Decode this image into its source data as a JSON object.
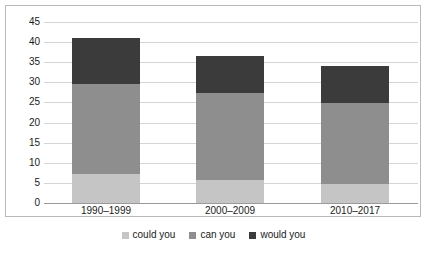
{
  "chart_data": {
    "type": "bar",
    "subtype": "stacked-column",
    "title": "",
    "xlabel": "",
    "ylabel": "",
    "categories": [
      "1990–1999",
      "2000–2009",
      "2010–2017"
    ],
    "series": [
      {
        "name": "could you",
        "color": "#c5c5c5",
        "values": [
          7.2,
          5.7,
          4.7
        ]
      },
      {
        "name": "can you",
        "color": "#8e8e8e",
        "values": [
          22.5,
          21.7,
          20.2
        ]
      },
      {
        "name": "would you",
        "color": "#3b3b3b",
        "values": [
          11.3,
          9.1,
          9.1
        ]
      }
    ],
    "totals": [
      41.0,
      36.5,
      34.0
    ],
    "ylim": [
      0,
      45
    ],
    "yticks": [
      0,
      5,
      10,
      15,
      20,
      25,
      30,
      35,
      40,
      45
    ],
    "ytick_labels": [
      "0",
      "5",
      "10",
      "15",
      "20",
      "25",
      "30",
      "35",
      "40",
      "45"
    ],
    "grid": "horizontal",
    "legend_position": "bottom"
  },
  "axis": {
    "y_labels": [
      "45",
      "40",
      "35",
      "30",
      "25",
      "20",
      "15",
      "10",
      "5",
      "0"
    ],
    "x_labels": [
      "1990–1999",
      "2000–2009",
      "2010–2017"
    ]
  },
  "legend": {
    "items": [
      {
        "label": "could you"
      },
      {
        "label": "can you"
      },
      {
        "label": "would you"
      }
    ]
  }
}
